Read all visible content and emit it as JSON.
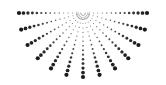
{
  "graphic": {
    "name": "half-sunburst-dots",
    "center": [
      83,
      13
    ],
    "ray_count": 13,
    "start_angle_deg": 0,
    "end_angle_deg": 180,
    "inner_radius": 6,
    "outer_radius": 64,
    "dots_per_ray": 14,
    "dot_color": "#1a1a1a",
    "background": "#ffffff",
    "min_dot_r": 0.5,
    "max_dot_r": 2.1
  }
}
